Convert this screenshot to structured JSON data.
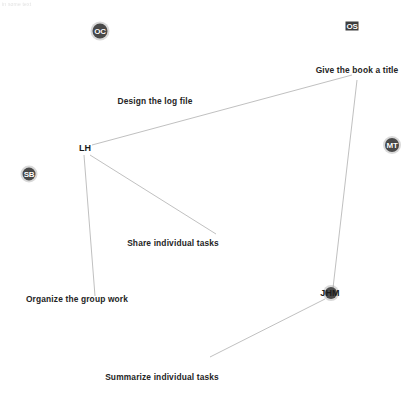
{
  "page": {
    "width": 413,
    "height": 396,
    "background": "#ffffff",
    "header_text": "in some text"
  },
  "diagram": {
    "type": "network-graph",
    "edge_color": "#b9b9b9",
    "node_color": "#4a4a4a",
    "label_color": "#242424"
  },
  "markers": [
    {
      "id": "OC",
      "label": "OC",
      "shape": "circle",
      "x": 100,
      "y": 31,
      "size": 15
    },
    {
      "id": "OS",
      "label": "OS",
      "shape": "square",
      "x": 352,
      "y": 26,
      "size": 13
    },
    {
      "id": "SB",
      "label": "SB",
      "shape": "circle",
      "x": 29,
      "y": 174,
      "size": 13
    },
    {
      "id": "MT",
      "label": "MT",
      "shape": "circle",
      "x": 392,
      "y": 145,
      "size": 14
    },
    {
      "id": "JHM-dot",
      "label": "",
      "shape": "circle",
      "x": 331,
      "y": 293,
      "size": 12
    }
  ],
  "vertices": [
    {
      "id": "LH",
      "label": "LH",
      "x": 85,
      "y": 148
    },
    {
      "id": "JHM",
      "label": "JHM",
      "x": 330,
      "y": 293
    },
    {
      "id": "give-title",
      "label": "Give the book a title",
      "x": 357,
      "y": 70
    },
    {
      "id": "design-log",
      "label": "Design the log file",
      "x": 155,
      "y": 101
    },
    {
      "id": "share-tasks",
      "label": "Share individual tasks",
      "x": 173,
      "y": 243
    },
    {
      "id": "organize-group",
      "label": "Organize the group work",
      "x": 77,
      "y": 299
    },
    {
      "id": "summarize-tasks",
      "label": "Summarize individual tasks",
      "x": 162,
      "y": 377
    }
  ],
  "edges": [
    {
      "from": "LH",
      "to": "give-title",
      "x1": 92,
      "y1": 145,
      "x2": 352,
      "y2": 75
    },
    {
      "from": "give-title",
      "to": "JHM",
      "x1": 357,
      "y1": 80,
      "x2": 333,
      "y2": 288
    },
    {
      "from": "LH",
      "to": "organize-group",
      "x1": 84,
      "y1": 155,
      "x2": 95,
      "y2": 296
    },
    {
      "from": "LH",
      "to": "share-tasks",
      "x1": 90,
      "y1": 155,
      "x2": 216,
      "y2": 234
    },
    {
      "from": "JHM",
      "to": "summarize-tasks",
      "x1": 325,
      "y1": 299,
      "x2": 210,
      "y2": 357
    }
  ],
  "tasks": [
    {
      "name": "give-the-book-a-title",
      "text": "Give the book a title"
    },
    {
      "name": "design-the-log-file",
      "text": "Design the log file"
    },
    {
      "name": "share-individual-tasks",
      "text": "Share individual tasks"
    },
    {
      "name": "organize-the-group-work",
      "text": "Organize the group work"
    },
    {
      "name": "summarize-individual-tasks",
      "text": "Summarize individual tasks"
    }
  ]
}
